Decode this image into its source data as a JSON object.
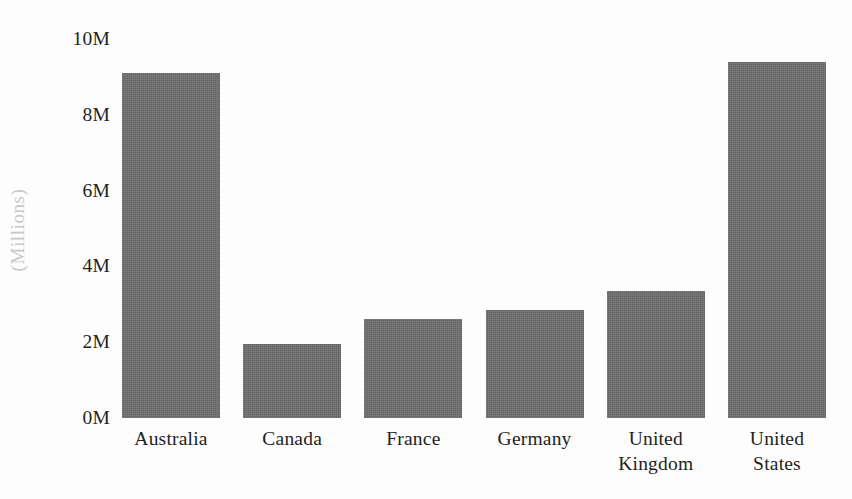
{
  "chart_data": {
    "type": "bar",
    "title": "",
    "subtitle": "",
    "xlabel": "",
    "ylabel": "(Millions)",
    "categories": [
      "Australia",
      "Canada",
      "France",
      "Germany",
      "United Kingdom",
      "United States"
    ],
    "category_lines": [
      [
        "Australia"
      ],
      [
        "Canada"
      ],
      [
        "France"
      ],
      [
        "Germany"
      ],
      [
        "United",
        "Kingdom"
      ],
      [
        "United",
        "States"
      ]
    ],
    "values": [
      9.1,
      1.95,
      2.6,
      2.85,
      3.35,
      9.4
    ],
    "value_unit": "millions",
    "ylim": [
      0,
      10
    ],
    "y_ticks": [
      0,
      2,
      4,
      6,
      8,
      10
    ],
    "y_tick_labels": [
      "0M",
      "2M",
      "4M",
      "6M",
      "8M",
      "10M"
    ],
    "grid": false,
    "legend": null,
    "legend_position": "none",
    "bar_color": "#6e6e6e",
    "background_color": "#fdfdfd",
    "axis_label_color": "#c8c8c8"
  }
}
